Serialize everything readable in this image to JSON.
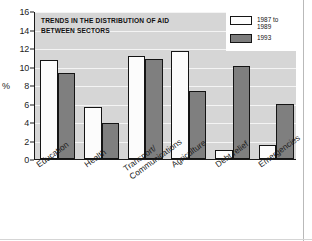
{
  "chart_data": {
    "type": "bar",
    "title": "TRENDS IN THE DISTRIBUTION OF AID BETWEEN SECTORS",
    "title_lines": [
      "TRENDS IN THE DISTRIBUTION OF AID",
      "BETWEEN SECTORS"
    ],
    "xlabel": "",
    "ylabel": "%",
    "ylim": [
      0,
      16
    ],
    "yticks": [
      0,
      2,
      4,
      6,
      8,
      10,
      12,
      14,
      16
    ],
    "grid": true,
    "legend_position": "top-right",
    "categories": [
      "Education",
      "Health",
      "Transport/ Communications",
      "Agriculture",
      "Debt relief",
      "Emergencies"
    ],
    "category_lines": [
      [
        "Education"
      ],
      [
        "Health"
      ],
      [
        "Transport/",
        "Communications"
      ],
      [
        "Agriculture"
      ],
      [
        "Debt relief"
      ],
      [
        "Emergencies"
      ]
    ],
    "series": [
      {
        "name": "1987 to 1989",
        "name_lines": [
          "1987 to",
          "1989"
        ],
        "color": "#fdfdfd",
        "values": [
          10.7,
          5.6,
          11.1,
          11.7,
          1.0,
          1.5
        ]
      },
      {
        "name": "1993",
        "name_lines": [
          "1993"
        ],
        "color": "#7f7f7f",
        "values": [
          9.3,
          3.9,
          10.8,
          7.4,
          10.1,
          5.9
        ]
      }
    ]
  },
  "colors": {
    "plot_background": "#d6d6d6",
    "gridline": "#f4f4f4",
    "axis": "#1a1a1a",
    "series_1987_1989": "#fdfdfd",
    "series_1993": "#7f7f7f",
    "text": "#1d1d1d"
  }
}
